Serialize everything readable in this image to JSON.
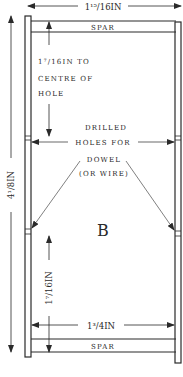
{
  "diagram": {
    "colors": {
      "ink": "#2a2a2a",
      "background": "#ffffff"
    },
    "labels": {
      "top_width": "1¹⁵/16IN",
      "top_spar": "SPAR",
      "hole_offset_line1": "1⁷/16IN TO",
      "hole_offset_line2": "CENTRE OF",
      "hole_offset_line3": "HOLE",
      "drilled_line1": "DRILLED",
      "drilled_line2": "HOLES FOR",
      "drilled_line3": "DOWEL",
      "drilled_line4": "(OR WIRE)",
      "panel_letter": "B",
      "overall_height": "4¹/8IN",
      "lower_hole_offset": "1⁷/16IN",
      "inner_width": "1³/4IN",
      "bottom_spar": "SPAR"
    }
  }
}
